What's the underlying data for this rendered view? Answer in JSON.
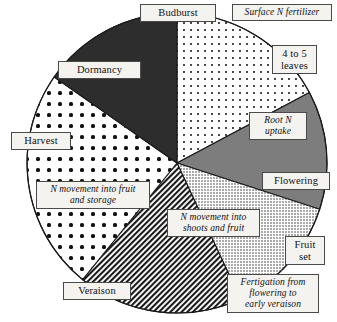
{
  "figure": {
    "center": {
      "x": 177,
      "y": 163
    },
    "radius": 150,
    "outline_color": "#1a1a1a",
    "label_box_fill": "#f4f3f0",
    "label_box_border": "#4a4a4a"
  },
  "chart_data": {
    "type": "pie",
    "title": "",
    "xlabel": "",
    "ylabel": "",
    "legend": "none",
    "grid": false,
    "note": "Angles measured clockwise from 12 o'clock (degrees).",
    "categories": [
      "Surface N fertilizer",
      "Root N uptake",
      "N movement into shoots and fruit",
      "Fertigation from flowering to early veraison",
      "N movement into fruit and storage",
      "Dormancy"
    ],
    "values": [
      17,
      13,
      13,
      18,
      24,
      15
    ],
    "slices": [
      {
        "label": "Surface N fertilizer",
        "start_deg": 0,
        "end_deg": 62,
        "value": 17,
        "fill": "fine-dots",
        "fill_color": "#ffffff",
        "pattern_ink": "#1a1a1a"
      },
      {
        "label": "Root N uptake",
        "start_deg": 62,
        "end_deg": 108,
        "value": 13,
        "fill": "solid-gray",
        "fill_color": "#7d7d7d",
        "pattern_ink": "#7d7d7d"
      },
      {
        "label": "N movement into shoots and fruit",
        "start_deg": 108,
        "end_deg": 155,
        "value": 13,
        "fill": "dense-stipple",
        "fill_color": "#ffffff",
        "pattern_ink": "#2b2b2b"
      },
      {
        "label": "Fertigation from flowering to early veraison",
        "start_deg": 155,
        "end_deg": 219,
        "value": 18,
        "fill": "diagonal-hatch",
        "fill_color": "#ffffff",
        "pattern_ink": "#1a1a1a"
      },
      {
        "label": "N movement into fruit and storage",
        "start_deg": 219,
        "end_deg": 305,
        "value": 24,
        "fill": "large-dots",
        "fill_color": "#ffffff",
        "pattern_ink": "#111111"
      },
      {
        "label": "Dormancy",
        "start_deg": 305,
        "end_deg": 360,
        "value": 15,
        "fill": "solid-dark",
        "fill_color": "#2d2d2d",
        "pattern_ink": "#2d2d2d"
      }
    ]
  },
  "stage_labels": [
    {
      "id": "budburst",
      "text": "Budburst",
      "style": "plain"
    },
    {
      "id": "leaves",
      "text": "4 to 5\nleaves",
      "style": "plain"
    },
    {
      "id": "flowering",
      "text": "Flowering",
      "style": "plain"
    },
    {
      "id": "fruit-set",
      "text": "Fruit\nset",
      "style": "plain"
    },
    {
      "id": "veraison",
      "text": "Veraison",
      "style": "plain"
    },
    {
      "id": "harvest",
      "text": "Harvest",
      "style": "plain"
    },
    {
      "id": "dormancy",
      "text": "Dormancy",
      "style": "plain"
    }
  ],
  "process_labels": [
    {
      "id": "surface-n",
      "text": "Surface N fertilizer",
      "style": "italic"
    },
    {
      "id": "root-n",
      "text": "Root N\nuptake",
      "style": "italic"
    },
    {
      "id": "n-shoots",
      "text": "N movement into\nshoots and fruit",
      "style": "italic"
    },
    {
      "id": "fertigation",
      "text": "Fertigation from\nflowering to\nearly veraison",
      "style": "italic"
    },
    {
      "id": "n-fruit",
      "text": "N movement into fruit\nand storage",
      "style": "italic"
    }
  ]
}
